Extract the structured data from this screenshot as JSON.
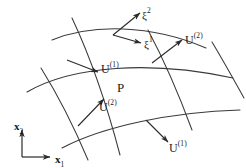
{
  "figure": {
    "stroke_color": "#333333",
    "background": "#ffffff",
    "width": 246,
    "height": 168
  },
  "labels": {
    "xi2": {
      "base": "ξ",
      "sup": "2"
    },
    "xi1": {
      "base": "ξ",
      "sup": "1"
    },
    "u2_upper": {
      "base": "U",
      "sup": "(2)"
    },
    "u1_upper": {
      "base": "U",
      "sup": "(1)"
    },
    "u2_lower": {
      "base": "U",
      "sup": "(2)"
    },
    "u1_lower": {
      "base": "U",
      "sup": "(1)"
    },
    "point_p": {
      "base": "P"
    },
    "axis_x2": {
      "base": "x",
      "sub": "2"
    },
    "axis_x1": {
      "base": "x",
      "sub": "1"
    }
  },
  "axes": {
    "origin": [
      22,
      157
    ],
    "x1_end": [
      52,
      157
    ],
    "x2_end": [
      22,
      128
    ]
  }
}
